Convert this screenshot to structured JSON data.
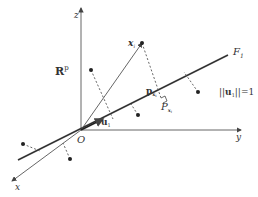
{
  "diagram": {
    "space_label": "R",
    "space_superscript": "p",
    "axes": {
      "z": "z",
      "y": "y",
      "x": "x"
    },
    "origin_label": "O",
    "line_label": "F",
    "line_label_sub": "1",
    "unit_vector_label": "u",
    "unit_vector_sub": "1",
    "point_label": "x",
    "point_label_sub": "i",
    "projection_vector_label": "p",
    "projection_vector_sub": "x",
    "projection_vector_subsub": "i",
    "projection_point_label": "P",
    "projection_point_sub": "x",
    "projection_point_subsub": "i",
    "norm_constraint": {
      "left": "||",
      "vec": "u",
      "vec_sub": "1",
      "right": "||=1"
    },
    "colors": {
      "line": "#333333",
      "axis": "#555555",
      "dashed": "#555555",
      "point": "#222222"
    }
  }
}
